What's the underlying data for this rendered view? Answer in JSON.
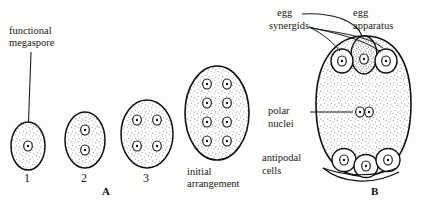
{
  "figure": {
    "background_color": "#fdfdfc",
    "ink_color": "#1a1a1a",
    "panels": [
      {
        "letter": "A",
        "caption": "A",
        "description": "Successive mitotic divisions of the functional megaspore"
      },
      {
        "letter": "B",
        "caption": "B",
        "description": "Mature embryo sac with egg apparatus, polar nuclei and antipodal cells"
      }
    ]
  },
  "panel_a": {
    "letter_label": "A",
    "callout": {
      "line1": "functional",
      "line2": "megaspore"
    },
    "final_label": {
      "line1": "initial",
      "line2": "arrangement"
    },
    "stages": [
      {
        "number": "1",
        "nuclei_count": 1,
        "nuclei_layout": "1"
      },
      {
        "number": "2",
        "nuclei_count": 2,
        "nuclei_layout": "2 stacked"
      },
      {
        "number": "3",
        "nuclei_count": 4,
        "nuclei_layout": "2 x 2"
      },
      {
        "number": "",
        "nuclei_count": 8,
        "nuclei_layout": "4 x 2"
      }
    ]
  },
  "panel_b": {
    "letter_label": "B",
    "labels": {
      "egg": "egg",
      "synergids": "synergids",
      "egg_apparatus_line1": "egg",
      "egg_apparatus_line2": "apparatus",
      "polar_line1": "polar",
      "polar_line2": "nuclei",
      "antipodal_line1": "antipodal",
      "antipodal_line2": "cells"
    },
    "structures": {
      "synergid_count": 2,
      "egg_cell_count": 1,
      "polar_nuclei_count": 2,
      "antipodal_cell_count": 3
    }
  }
}
